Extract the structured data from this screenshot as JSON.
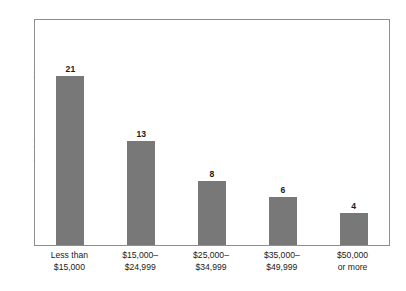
{
  "chart_data": {
    "type": "bar",
    "title": "",
    "subtitle": "",
    "xlabel": "",
    "ylabel": "Percent of Adults Age 18 or Older",
    "categories": [
      "Less than $15,000",
      "$15,000–$24,999",
      "$25,000–$34,999",
      "$35,000–$49,999",
      "$50,000 or more"
    ],
    "category_lines": [
      [
        "Less than",
        "$15,000"
      ],
      [
        "$15,000–",
        "$24,999"
      ],
      [
        "$25,000–",
        "$34,999"
      ],
      [
        "$35,000–",
        "$49,999"
      ],
      [
        "$50,000",
        "or more"
      ]
    ],
    "values": [
      21,
      13,
      8,
      6,
      4
    ],
    "value_labels": [
      "21",
      "13",
      "8",
      "6",
      "4"
    ],
    "ylim": [
      0,
      28
    ],
    "grid": false,
    "legend": false,
    "bar_color": "#787878",
    "frame_color": "#8e8e8e",
    "background_color": "#ffffff",
    "text_color": "#1a1a1a"
  }
}
